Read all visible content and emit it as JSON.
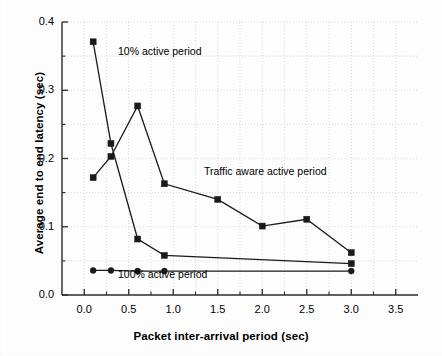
{
  "chart_data": {
    "type": "line",
    "title": "",
    "xlabel": "Packet inter-arrival period (sec)",
    "ylabel": "Average end to end latency (sec)",
    "xlim": [
      -0.25,
      3.75
    ],
    "ylim": [
      0.0,
      0.4
    ],
    "xticks": [
      "0.0",
      "0.5",
      "1.0",
      "1.5",
      "2.0",
      "2.5",
      "3.0",
      "3.5"
    ],
    "xtick_values": [
      0.0,
      0.5,
      1.0,
      1.5,
      2.0,
      2.5,
      3.0,
      3.5
    ],
    "yticks": [
      "0.0",
      "0.1",
      "0.2",
      "0.3",
      "0.4"
    ],
    "ytick_values": [
      0.0,
      0.1,
      0.2,
      0.3,
      0.4
    ],
    "minor_xticks": [
      0.25,
      0.75,
      1.25,
      1.75,
      2.25,
      2.75,
      3.25
    ],
    "minor_yticks": [
      0.05,
      0.15,
      0.25,
      0.35
    ],
    "grid": true,
    "grid_style": "dotted",
    "grid_color": "#cfcfcf",
    "legend_position": "inline-annotations",
    "line_color": "#1a1a1a",
    "series": [
      {
        "name": "10% active period",
        "marker": "square",
        "annotation": "10% active period",
        "x": [
          0.1,
          0.3,
          0.6,
          0.9,
          3.0
        ],
        "values": [
          0.371,
          0.222,
          0.082,
          0.058,
          0.046
        ]
      },
      {
        "name": "Traffic aware active period",
        "marker": "square",
        "annotation": "Traffic aware active period",
        "x": [
          0.1,
          0.3,
          0.6,
          0.9,
          1.5,
          2.0,
          2.5,
          3.0
        ],
        "values": [
          0.172,
          0.203,
          0.277,
          0.163,
          0.14,
          0.101,
          0.111,
          0.062
        ]
      },
      {
        "name": "100% active period",
        "marker": "circle",
        "annotation": "100% active period",
        "x": [
          0.1,
          0.3,
          0.6,
          0.9,
          3.0
        ],
        "values": [
          0.036,
          0.036,
          0.035,
          0.035,
          0.035
        ]
      }
    ],
    "annotations": [
      {
        "text": "10% active period",
        "x_px": 118,
        "y_px": 45
      },
      {
        "text": "Traffic aware active period",
        "x_px": 204,
        "y_px": 165
      },
      {
        "text": "100% active period",
        "x_px": 118,
        "y_px": 268
      }
    ]
  }
}
